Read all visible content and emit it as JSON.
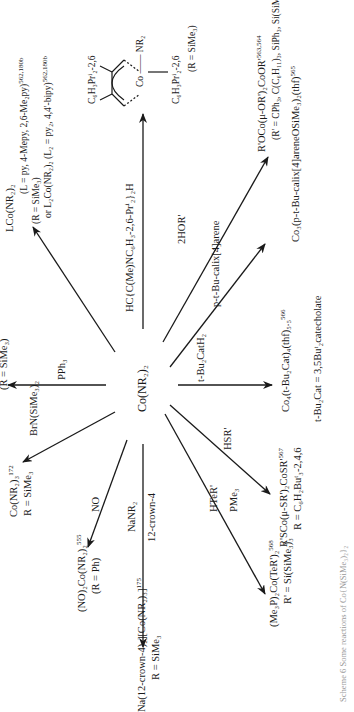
{
  "scheme": {
    "orientation": "rotated-90-ccw",
    "center": {
      "text": "Co(NR₂)₂"
    },
    "reactions": [
      {
        "id": "pph3",
        "reagent": "PPh₃",
        "product": "",
        "note": "(R = SiMe₃)"
      },
      {
        "id": "pyridine",
        "reagent": "",
        "product": "LCo(NR₂)₂",
        "product_sup": "",
        "note_1": "(L = py, 4-Mepy, 2,6-Me₂py)",
        "note_1_ref": "562,180b",
        "note_2": "(R = SiMe₃)",
        "note_3": "or L₂Co(NR₂)₂ (L₂ = py₂, 4,4'-bipy)",
        "note_3_ref": "562,180b"
      },
      {
        "id": "nacnac",
        "reagent": "HC{C(Me)NC₆H₃-2,6-Prⁱ₂}₂H",
        "product_top": "C₆H₃Prⁱ₂-2,6",
        "product_mid": "Co —— NR₂",
        "product_bottom": "C₆H₃Prⁱ₂-2,6",
        "note": "(R = SiMe₃)"
      },
      {
        "id": "alkoxide",
        "reagent": "2HOR'",
        "product": "R'OCo(μ-OR')₂CoOR'",
        "product_ref": "563,564",
        "note": "(R' = CPh₃, C(C₆H₁₁)₃, SiPh₃, Si(SiMe₃)₃)"
      },
      {
        "id": "calixarene",
        "reagent": "p-t-Bu-calix[4]arene",
        "product": "Co₃(p-t-Bu-calix[4]areneOSiMe₃)₂(thf)",
        "product_ref": "565"
      },
      {
        "id": "catechol",
        "reagent": "t-Bu₂CatH₂",
        "product": "Co₄(t-Bu₂Cat)₄(thf)₅.₅",
        "product_ref": "566",
        "note": "t-Bu₂Cat = 3,5Buᵗ₂catecholate"
      },
      {
        "id": "thiol",
        "reagent": "HSR'",
        "product": "R'SCo(μ-SR')₂CoSR'",
        "product_ref": "567",
        "note": "R = C₆H₂Buᵗ₃-2,4,6"
      },
      {
        "id": "tellurol",
        "reagent": "HTeR'",
        "reagent_2": "PMe₃",
        "product": "(Me₃P)₂Co(TeR')₂",
        "product_ref": "568",
        "note": "R' = Si(SiMe₃)₃"
      },
      {
        "id": "nanr2",
        "reagent": "NaNR₂",
        "reagent_2": "12-crown-4",
        "product": "Na(12-crown-4)₂][Co(NR₂)₃]",
        "product_ref": "175",
        "note": "R = SiMe₃"
      },
      {
        "id": "nitrosyl",
        "reagent": "NO",
        "product": "(NO)₂Co(NR₂)₂",
        "product_ref": "555",
        "note": "(R = Ph)"
      },
      {
        "id": "brn",
        "reagent": "BrN(SiMe₃)₂",
        "product": "Co(NR₂)₃",
        "product_ref": "172",
        "note": "R = SiMe₃"
      }
    ],
    "caption": "Scheme 6 Some reactions of Co{N(SiMe₃)₂}₂"
  },
  "colors": {
    "ink": "#1a1a1a",
    "background": "#ffffff",
    "caption": "#9a9a9a"
  }
}
